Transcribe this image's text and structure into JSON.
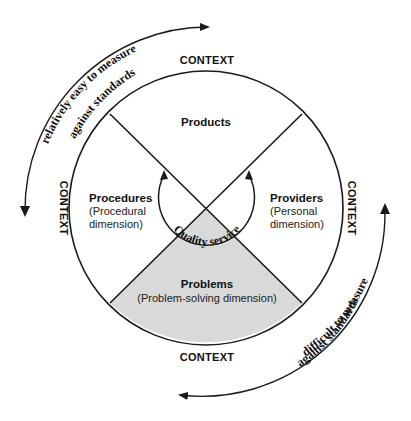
{
  "diagram": {
    "context_labels": {
      "top": "CONTEXT",
      "bottom": "CONTEXT",
      "left": "CONTEXT",
      "right": "CONTEXT"
    },
    "segments": {
      "top": {
        "title": "Products"
      },
      "left": {
        "title": "Procedures",
        "subtitle_line1": "(Procedural",
        "subtitle_line2": "dimension)"
      },
      "right": {
        "title": "Providers",
        "subtitle_line1": "(Personal",
        "subtitle_line2": "dimension)"
      },
      "bottom": {
        "title": "Problems",
        "subtitle": "(Problem-solving dimension)"
      }
    },
    "center_label": "Quality service",
    "outer_arrows": {
      "top_left_line1": "relatively easy to measure",
      "top_left_line2": "against standards",
      "bottom_right_line1": "difficult to measure",
      "bottom_right_line2": "against standards"
    },
    "colors": {
      "stroke": "#1a1a1a",
      "shaded_segment": "#d9d9d9",
      "background": "#ffffff"
    }
  }
}
